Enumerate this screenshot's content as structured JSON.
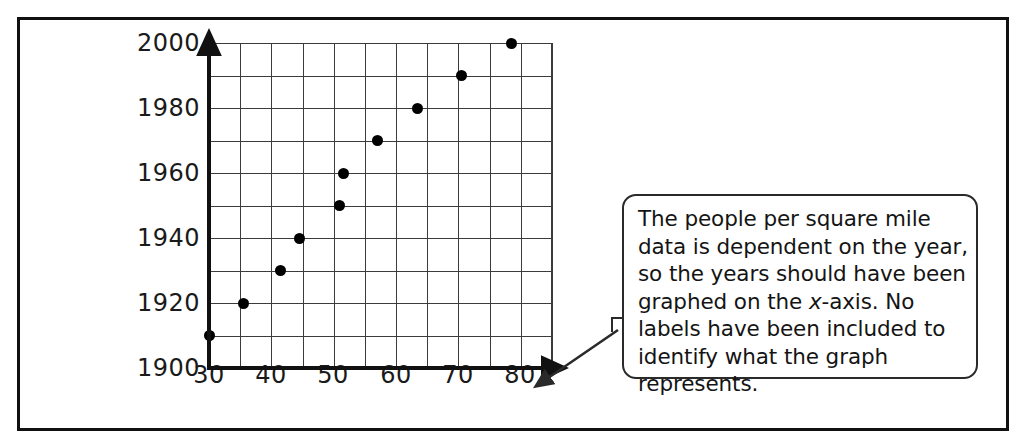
{
  "figure": {
    "outer_frame": true,
    "callout": {
      "text_parts": [
        "The people per square mile data is dependent on the year, so the years should have been graphed on the ",
        "x",
        "-axis. No labels have been included to identify what the graph represents."
      ],
      "full_text": "The people per square mile data is dependent on the year, so the years should have been graphed on the x-axis. No labels have been included to identify what the graph represents.",
      "pointer": "arrow-to-x-axis-end"
    },
    "colors": {
      "ink": "#111111",
      "grid": "#3b3b3b",
      "point": "#000000",
      "background": "#ffffff"
    }
  },
  "chart_data": {
    "type": "scatter",
    "title": "",
    "xlabel": "",
    "ylabel": "",
    "xlim": [
      30,
      85
    ],
    "ylim": [
      1900,
      2000
    ],
    "xticks": [
      "30",
      "40",
      "50",
      "60",
      "70",
      "80"
    ],
    "xtick_values": [
      30,
      40,
      50,
      60,
      70,
      80
    ],
    "yticks": [
      "2000",
      "1980",
      "1960",
      "1940",
      "1920",
      "1900"
    ],
    "ytick_values": [
      2000,
      1980,
      1960,
      1940,
      1920,
      1900
    ],
    "grid": true,
    "grid_x_step": 5,
    "grid_y_step": 10,
    "legend": null,
    "x": [
      30,
      35.5,
      41.5,
      44.5,
      51,
      51.5,
      57,
      63.5,
      70.5,
      78.5
    ],
    "y": [
      1910,
      1920,
      1930,
      1940,
      1950,
      1960,
      1970,
      1980,
      1990,
      2000
    ],
    "points": [
      {
        "x": 30,
        "y": 1910
      },
      {
        "x": 35.5,
        "y": 1920
      },
      {
        "x": 41.5,
        "y": 1930
      },
      {
        "x": 44.5,
        "y": 1940
      },
      {
        "x": 51,
        "y": 1950
      },
      {
        "x": 51.5,
        "y": 1960
      },
      {
        "x": 57,
        "y": 1970
      },
      {
        "x": 63.5,
        "y": 1980
      },
      {
        "x": 70.5,
        "y": 1990
      },
      {
        "x": 78.5,
        "y": 2000
      }
    ]
  }
}
